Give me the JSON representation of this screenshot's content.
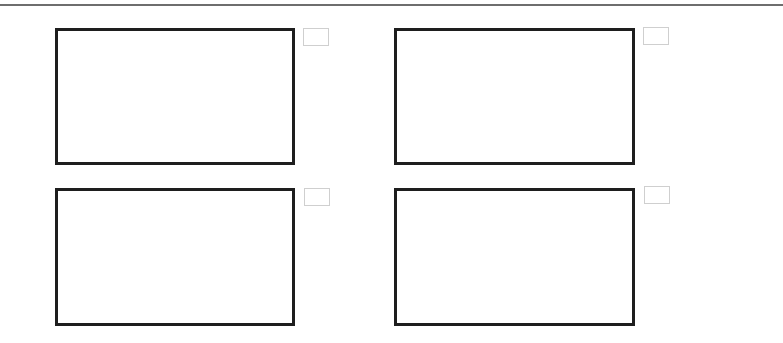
{
  "page": {
    "rule_color": "#6e6e6e",
    "panel_border_color": "#1e1e1e",
    "tag_border_color": "#cfcfcf"
  },
  "panels": [
    {
      "label": "",
      "tag": ""
    },
    {
      "label": "",
      "tag": ""
    },
    {
      "label": "",
      "tag": ""
    },
    {
      "label": "",
      "tag": ""
    }
  ]
}
